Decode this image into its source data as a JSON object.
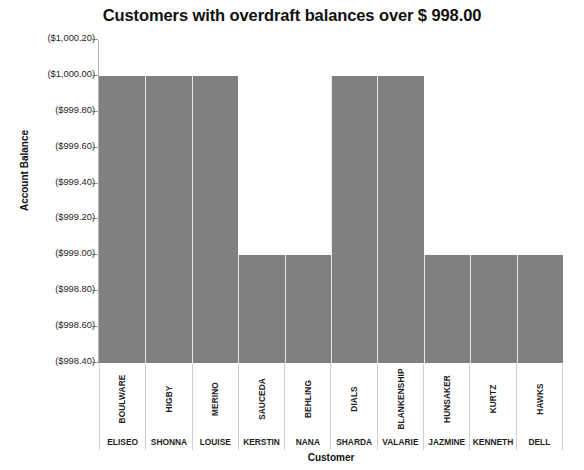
{
  "chart_data": {
    "type": "bar",
    "title": "Customers with overdraft balances over $ 998.00",
    "xlabel": "Customer",
    "ylabel": "Account Balance",
    "grid": false,
    "legend": "none",
    "orientation": "vertical",
    "ylim": [
      -998.4,
      -1000.2
    ],
    "y_tick_labels": [
      "($1,000.20)",
      "($1,000.00)",
      "($999.80)",
      "($999.60)",
      "($999.40)",
      "($999.20)",
      "($999.00)",
      "($998.80)",
      "($998.60)",
      "($998.40)"
    ],
    "y_tick_values": [
      -1000.2,
      -1000.0,
      -999.8,
      -999.6,
      -999.4,
      -999.2,
      -999.0,
      -998.8,
      -998.6,
      -998.4
    ],
    "categories": [
      "BOULWARE",
      "HIGBY",
      "MERINO",
      "SAUCEDA",
      "BEHLING",
      "DIALS",
      "BLANKENSHIP",
      "HUNSAKER",
      "KURTZ",
      "HAWKS"
    ],
    "categories_first_name": [
      "ELISEO",
      "SHONNA",
      "LOUISE",
      "KERSTIN",
      "NANA",
      "SHARDA",
      "VALARIE",
      "JAZMINE",
      "KENNETH",
      "DELL"
    ],
    "values": [
      -1000.0,
      -1000.0,
      -1000.0,
      -999.0,
      -999.0,
      -1000.0,
      -1000.0,
      -999.0,
      -999.0,
      -999.0
    ],
    "value_labels": [
      "($1,000.00)",
      "($1,000.00)",
      "($1,000.00)",
      "($999.00)",
      "($999.00)",
      "($1,000.00)",
      "($1,000.00)",
      "($999.00)",
      "($999.00)",
      "($999.00)"
    ],
    "bar_color": "#808080",
    "bar_separator_color": "#e8e8e8",
    "axis_color": "#b4b4b4",
    "text_color": "#1a1a1a",
    "background": "#ffffff"
  }
}
